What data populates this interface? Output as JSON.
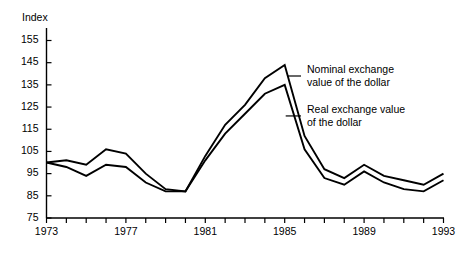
{
  "chart_data": {
    "type": "line",
    "title": "",
    "xlabel": "",
    "ylabel": "Index",
    "ylim": [
      75,
      155
    ],
    "xlim": [
      1973,
      1993
    ],
    "grid": false,
    "legend_position": "inline-right-annotation",
    "yticks": [
      75,
      85,
      95,
      105,
      115,
      125,
      135,
      145,
      155
    ],
    "ytick_labels": [
      "75",
      "85",
      "95",
      "105",
      "115",
      "125",
      "135",
      "145",
      "155"
    ],
    "xticks": [
      1973,
      1974,
      1975,
      1976,
      1977,
      1978,
      1979,
      1980,
      1981,
      1982,
      1983,
      1984,
      1985,
      1986,
      1987,
      1988,
      1989,
      1990,
      1991,
      1992,
      1993
    ],
    "xtick_labels_shown": [
      "1973",
      "1977",
      "1981",
      "1985",
      "1989",
      "1993"
    ],
    "xtick_label_years": [
      1973,
      1977,
      1981,
      1985,
      1989,
      1993
    ],
    "x": [
      1973,
      1974,
      1975,
      1976,
      1977,
      1978,
      1979,
      1980,
      1981,
      1982,
      1983,
      1984,
      1985,
      1986,
      1987,
      1988,
      1989,
      1990,
      1991,
      1992,
      1993
    ],
    "series": [
      {
        "name": "Nominal exchange value of the dollar",
        "color": "#000000",
        "values": [
          100,
          101,
          99,
          106,
          104,
          95,
          88,
          87,
          103,
          117,
          126,
          138,
          144,
          112,
          97,
          93,
          99,
          94,
          92,
          90,
          95
        ]
      },
      {
        "name": "Real exchange value of the dollar",
        "color": "#000000",
        "values": [
          100,
          98,
          94,
          99,
          98,
          91,
          87,
          87,
          101,
          113,
          122,
          131,
          135,
          106,
          93,
          90,
          96,
          91,
          88,
          87,
          92
        ]
      }
    ],
    "annotations": [
      {
        "id": "nominal-annotation",
        "line1": "Nominal exchange",
        "line2": "value of the dollar",
        "anchor_year": 1985,
        "anchor_value": 139
      },
      {
        "id": "real-annotation",
        "line1": "Real exchange value",
        "line2": "of the dollar",
        "anchor_year": 1985,
        "anchor_value": 121
      }
    ]
  },
  "axis": {
    "y_title": "Index"
  }
}
